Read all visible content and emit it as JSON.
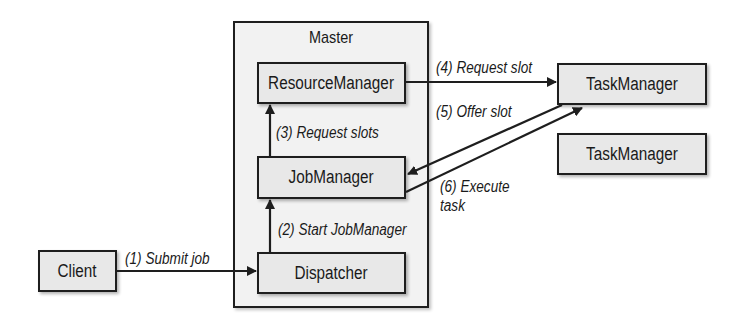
{
  "diagram": {
    "container": {
      "label": "Master"
    },
    "nodes": {
      "resource_manager": {
        "label": "ResourceManager"
      },
      "job_manager": {
        "label": "JobManager"
      },
      "dispatcher": {
        "label": "Dispatcher"
      },
      "client": {
        "label": "Client"
      },
      "task_manager_1": {
        "label": "TaskManager"
      },
      "task_manager_2": {
        "label": "TaskManager"
      }
    },
    "edges": [
      {
        "id": 1,
        "from": "Client",
        "to": "Dispatcher",
        "label": "(1) Submit job"
      },
      {
        "id": 2,
        "from": "Dispatcher",
        "to": "JobManager",
        "label": "(2) Start JobManager"
      },
      {
        "id": 3,
        "from": "JobManager",
        "to": "ResourceManager",
        "label": "(3) Request slots"
      },
      {
        "id": 4,
        "from": "ResourceManager",
        "to": "TaskManager",
        "label": "(4) Request slot"
      },
      {
        "id": 5,
        "from": "TaskManager",
        "to": "JobManager",
        "label": "(5) Offer slot"
      },
      {
        "id": 6,
        "from": "JobManager",
        "to": "TaskManager",
        "label_line1": "(6) Execute",
        "label_line2": "task"
      }
    ],
    "colors": {
      "background": "#ffffff",
      "container_fill": "#f2f2f2",
      "node_fill": "#e8e8e8",
      "stroke": "#1e1e1e"
    }
  }
}
